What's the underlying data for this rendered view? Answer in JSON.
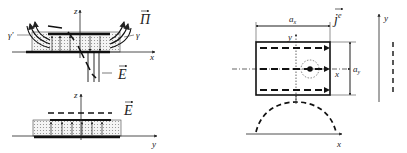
{
  "left_top": {
    "axis_z": "z",
    "axis_x": "x",
    "label_poynting": "Π",
    "label_field": "E",
    "label_gamma_left": "γ'",
    "label_gamma_right": "γ"
  },
  "left_bottom": {
    "axis_z": "z",
    "axis_y": "y",
    "label_field": "E"
  },
  "right_panel": {
    "label_current": "j",
    "label_current_sup": "e",
    "dim_x": "a",
    "dim_x_sub": "x",
    "dim_y": "a",
    "dim_y_sub": "y",
    "axis_y": "y",
    "axis_x": "x",
    "profile_axis_x": "x",
    "side_axis_y": "y"
  },
  "colors": {
    "ink": "#222222",
    "dots": "#999999",
    "background": "#ffffff"
  }
}
